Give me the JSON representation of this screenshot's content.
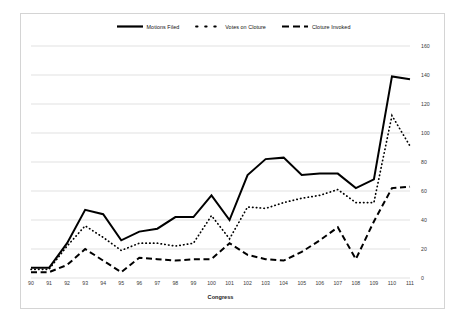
{
  "chart_data": {
    "type": "line",
    "title": "",
    "xlabel": "Congress",
    "ylabel": "",
    "categories": [
      "90",
      "91",
      "92",
      "93",
      "94",
      "95",
      "96",
      "97",
      "98",
      "99",
      "100",
      "101",
      "102",
      "103",
      "104",
      "105",
      "106",
      "107",
      "108",
      "109",
      "110",
      "111"
    ],
    "ylim": [
      0,
      160
    ],
    "yticks": [
      0,
      20,
      40,
      60,
      80,
      100,
      120,
      140,
      160
    ],
    "grid": true,
    "legend_position": "top-center",
    "axis_side": "right",
    "series": [
      {
        "name": "Motions Filed",
        "style": "solid",
        "color": "#000000",
        "values": [
          7,
          7,
          24,
          47,
          44,
          26,
          32,
          34,
          42,
          42,
          57,
          40,
          71,
          82,
          83,
          71,
          72,
          72,
          62,
          68,
          139,
          137
        ]
      },
      {
        "name": "Votes on Cloture",
        "style": "dotted",
        "color": "#000000",
        "values": [
          6,
          6,
          22,
          36,
          28,
          19,
          24,
          24,
          22,
          24,
          43,
          27,
          49,
          48,
          52,
          55,
          57,
          61,
          52,
          52,
          112,
          91
        ]
      },
      {
        "name": "Cloture Invoked",
        "style": "dashed",
        "color": "#000000",
        "values": [
          4,
          4,
          9,
          20,
          12,
          4,
          14,
          13,
          12,
          13,
          13,
          24,
          16,
          13,
          12,
          18,
          26,
          35,
          13,
          39,
          62,
          63
        ]
      }
    ]
  },
  "legend": {
    "items": [
      {
        "label": "Motions Filed",
        "icon": "solid-line-swatch"
      },
      {
        "label": "Votes on Cloture",
        "icon": "dotted-line-swatch"
      },
      {
        "label": "Cloture Invoked",
        "icon": "dashed-line-swatch"
      }
    ]
  }
}
